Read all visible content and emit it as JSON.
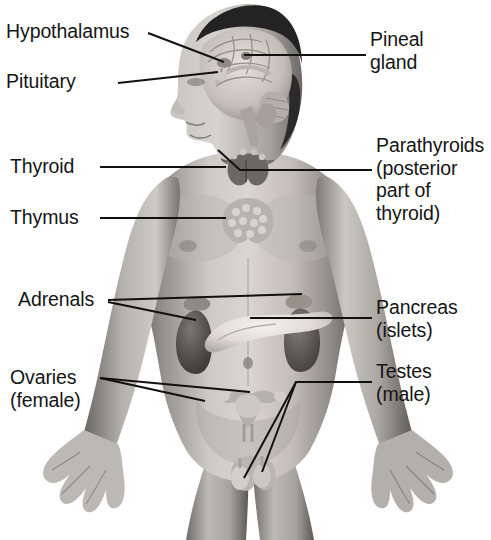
{
  "diagram": {
    "background_color": "#ffffff",
    "text_color": "#151515",
    "leader_line_color": "#111111",
    "width": 491,
    "height": 540
  },
  "labels": {
    "hypothalamus": "Hypothalamus",
    "pituitary": "Pituitary",
    "pineal_gland": "Pineal\ngland",
    "thyroid": "Thyroid",
    "thymus": "Thymus",
    "parathyroids": "Parathyroids\n(posterior\npart of\nthyroid)",
    "adrenals": "Adrenals",
    "pancreas": "Pancreas\n(islets)",
    "ovaries": "Ovaries\n(female)",
    "testes": "Testes\n(male)"
  },
  "anatomy_parts": [
    {
      "name": "brain",
      "label_ref": "hypothalamus",
      "side": "left"
    },
    {
      "name": "pituitary-gland",
      "label_ref": "pituitary",
      "side": "left"
    },
    {
      "name": "pineal-gland",
      "label_ref": "pineal_gland",
      "side": "right"
    },
    {
      "name": "thyroid-gland",
      "label_ref": "thyroid",
      "side": "left"
    },
    {
      "name": "thymus-gland",
      "label_ref": "thymus",
      "side": "left"
    },
    {
      "name": "parathyroid-glands",
      "label_ref": "parathyroids",
      "side": "right"
    },
    {
      "name": "adrenal-glands",
      "label_ref": "adrenals",
      "side": "left"
    },
    {
      "name": "pancreas-islets",
      "label_ref": "pancreas",
      "side": "right"
    },
    {
      "name": "ovaries",
      "label_ref": "ovaries",
      "side": "left"
    },
    {
      "name": "testes",
      "label_ref": "testes",
      "side": "right"
    }
  ],
  "colors": {
    "skin_light": "#d8d4cf",
    "skin_mid": "#a9a5a0",
    "skin_dark": "#6f6b67",
    "shadow": "#4a4845",
    "hair": "#232323",
    "organ_dark": "#565350",
    "organ_light": "#e8e5df"
  }
}
